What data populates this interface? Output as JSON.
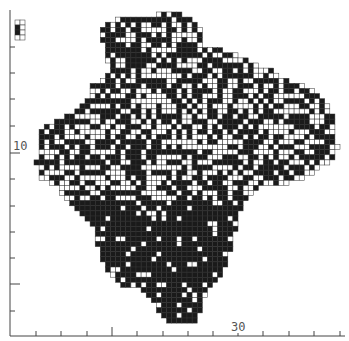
{
  "map": {
    "type": "grid-square distribution map",
    "cell_size": 5.1,
    "colors": {
      "present": "#1a1a1a",
      "grid": "#333333",
      "background": "#ffffff",
      "axis": "#444444"
    },
    "outline": [
      [
        116,
        20
      ],
      [
        130,
        17
      ],
      [
        150,
        16
      ],
      [
        168,
        12
      ],
      [
        190,
        16
      ],
      [
        200,
        28
      ],
      [
        204,
        48
      ],
      [
        220,
        50
      ],
      [
        232,
        54
      ],
      [
        244,
        58
      ],
      [
        250,
        62
      ],
      [
        262,
        66
      ],
      [
        270,
        70
      ],
      [
        285,
        78
      ],
      [
        296,
        84
      ],
      [
        316,
        90
      ],
      [
        330,
        106
      ],
      [
        336,
        132
      ],
      [
        338,
        148
      ],
      [
        332,
        160
      ],
      [
        318,
        170
      ],
      [
        300,
        180
      ],
      [
        280,
        186
      ],
      [
        258,
        188
      ],
      [
        248,
        196
      ],
      [
        240,
        212
      ],
      [
        236,
        228
      ],
      [
        232,
        246
      ],
      [
        228,
        260
      ],
      [
        222,
        276
      ],
      [
        210,
        286
      ],
      [
        204,
        298
      ],
      [
        200,
        314
      ],
      [
        194,
        324
      ],
      [
        182,
        326
      ],
      [
        168,
        322
      ],
      [
        158,
        314
      ],
      [
        150,
        296
      ],
      [
        142,
        290
      ],
      [
        124,
        286
      ],
      [
        110,
        276
      ],
      [
        100,
        258
      ],
      [
        96,
        238
      ],
      [
        92,
        222
      ],
      [
        78,
        212
      ],
      [
        64,
        200
      ],
      [
        58,
        186
      ],
      [
        50,
        184
      ],
      [
        40,
        178
      ],
      [
        36,
        162
      ],
      [
        40,
        150
      ],
      [
        36,
        140
      ],
      [
        42,
        126
      ],
      [
        56,
        122
      ],
      [
        68,
        114
      ],
      [
        80,
        108
      ],
      [
        88,
        100
      ],
      [
        90,
        86
      ],
      [
        100,
        80
      ],
      [
        112,
        72
      ],
      [
        106,
        58
      ],
      [
        104,
        44
      ],
      [
        98,
        34
      ],
      [
        104,
        24
      ]
    ],
    "inset": {
      "x": 15,
      "y": 20,
      "w": 10,
      "h": 20
    }
  },
  "axes": {
    "x_axis": {
      "y": 336,
      "x_start": 10,
      "x_end": 345,
      "ticks": [
        36,
        61,
        87,
        112,
        137,
        163,
        188,
        213,
        238,
        263,
        289,
        314,
        340
      ],
      "major_ticks": [
        112,
        238
      ],
      "labels": [
        {
          "text": "30",
          "x": 238
        }
      ]
    },
    "y_axis": {
      "x": 10,
      "y_start": 10,
      "y_end": 336,
      "ticks": [
        47,
        73,
        99,
        126,
        153,
        179,
        206,
        232,
        258,
        284,
        311
      ],
      "major_ticks": [
        153,
        284
      ],
      "labels": [
        {
          "text": "10",
          "y": 153
        }
      ]
    }
  }
}
